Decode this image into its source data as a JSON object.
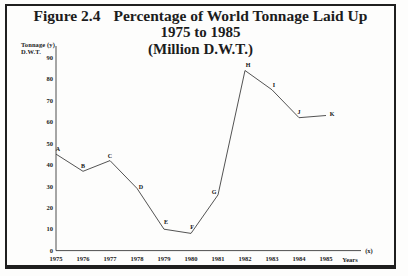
{
  "figure": {
    "label": "Figure 2.4",
    "title_line1": "Percentage of World Tonnage Laid Up",
    "title_line2": "1975 to 1985",
    "title_line3": "(Million D.W.T.)"
  },
  "axes": {
    "y_caption_line1": "Tonnage (y)",
    "y_caption_line2": "D.W.T.",
    "x_caption": "Years",
    "x_axis_suffix": "(x)"
  },
  "colors": {
    "ink": "#1c1c1c",
    "curve": "#3f3f3f",
    "frame_border": "#1f1f1f",
    "background": "#fdfdfc"
  },
  "chart_data": {
    "type": "line",
    "xlabel": "Years (x)",
    "ylabel": "Tonnage D.W.T. (y)",
    "xlim": [
      1975,
      1985
    ],
    "ylim": [
      0,
      90
    ],
    "yticks": [
      0,
      10,
      20,
      30,
      40,
      50,
      60,
      70,
      80,
      90
    ],
    "xticks": [
      1975,
      1976,
      1977,
      1978,
      1979,
      1980,
      1981,
      1982,
      1983,
      1984,
      1985
    ],
    "grid": false,
    "legend": "none",
    "series": [
      {
        "name": "World tonnage laid up (Million D.W.T.)",
        "points": [
          {
            "label": "A",
            "year": 1975,
            "value": 45,
            "label_offset": [
              2,
              -5
            ]
          },
          {
            "label": "B",
            "year": 1976,
            "value": 37,
            "label_offset": [
              0,
              -5
            ]
          },
          {
            "label": "C",
            "year": 1977,
            "value": 42,
            "label_offset": [
              0,
              -5
            ]
          },
          {
            "label": "D",
            "year": 1978,
            "value": 29,
            "label_offset": [
              4,
              -1
            ]
          },
          {
            "label": "E",
            "year": 1979,
            "value": 10,
            "label_offset": [
              2,
              -7
            ]
          },
          {
            "label": "F",
            "year": 1980,
            "value": 8,
            "label_offset": [
              1,
              -6
            ]
          },
          {
            "label": "G",
            "year": 1981,
            "value": 26,
            "label_offset": [
              -4,
              -3
            ]
          },
          {
            "label": "H",
            "year": 1982,
            "value": 84,
            "label_offset": [
              3,
              -6
            ]
          },
          {
            "label": "I",
            "year": 1983,
            "value": 75,
            "label_offset": [
              2,
              -5
            ]
          },
          {
            "label": "J",
            "year": 1984,
            "value": 62,
            "label_offset": [
              0,
              -6
            ]
          },
          {
            "label": "K",
            "year": 1985,
            "value": 63,
            "label_offset": [
              6,
              -2
            ]
          }
        ]
      }
    ]
  }
}
